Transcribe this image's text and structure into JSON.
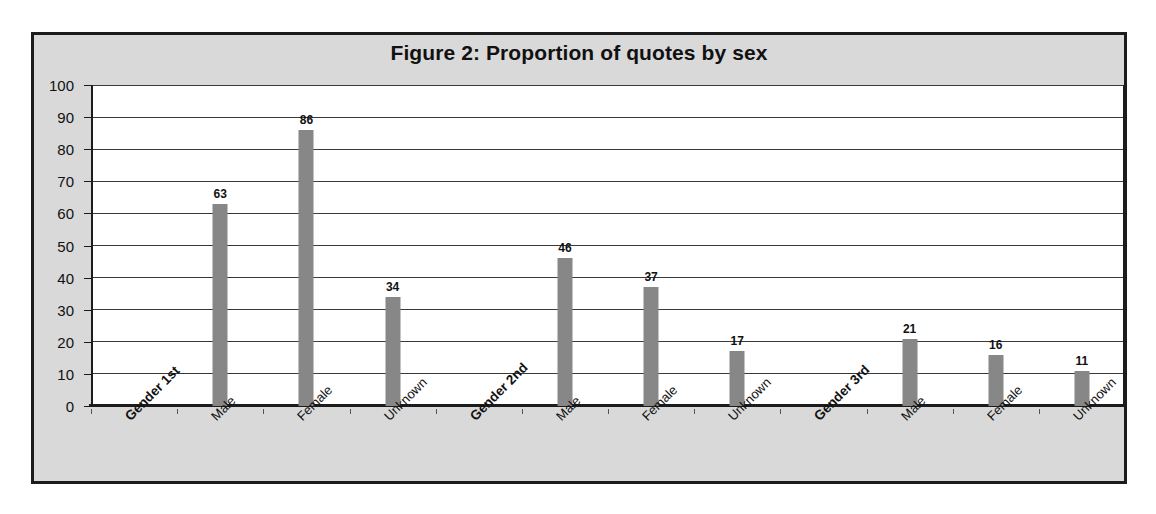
{
  "figure": {
    "title": "Figure 2: Proportion of quotes by sex",
    "frame_color": "#1c1c1c",
    "frame_background": "#d9d9d9",
    "plot_background": "#ffffff",
    "bar_color": "#878787",
    "gridline_color": "#3a3a3a"
  },
  "chart_data": {
    "type": "bar",
    "title": "Figure 2: Proportion of quotes by sex",
    "xlabel": "",
    "ylabel": "",
    "ylim": [
      0,
      100
    ],
    "ytick_step": 10,
    "yticks": [
      100,
      90,
      80,
      70,
      60,
      50,
      40,
      30,
      20,
      10,
      0
    ],
    "grid": true,
    "legend": "none",
    "value_labels": true,
    "categories": [
      "Gender 1st",
      "Male",
      "Female",
      "Unknown",
      "Gender 2nd",
      "Male",
      "Female",
      "Unknown",
      "Gender 3rd",
      "Male",
      "Female",
      "Unknown"
    ],
    "category_is_group_header": [
      true,
      false,
      false,
      false,
      true,
      false,
      false,
      false,
      true,
      false,
      false,
      false
    ],
    "values": [
      null,
      63,
      86,
      34,
      null,
      46,
      37,
      17,
      null,
      21,
      16,
      11
    ],
    "value_text": [
      "",
      "63",
      "86",
      "34",
      "",
      "46",
      "37",
      "17",
      "",
      "21",
      "16",
      "11"
    ],
    "series": [
      {
        "name": "Proportion of quotes",
        "values": [
          null,
          63,
          86,
          34,
          null,
          46,
          37,
          17,
          null,
          21,
          16,
          11
        ]
      }
    ]
  }
}
